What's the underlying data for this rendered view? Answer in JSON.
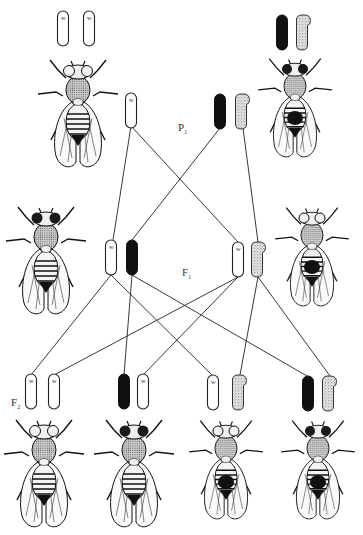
{
  "diagram": {
    "generations": [
      {
        "id": "P1",
        "label": "P",
        "subscript": "1",
        "x": 178,
        "y": 130
      },
      {
        "id": "F1",
        "label": "F",
        "subscript": "1",
        "x": 183,
        "y": 275
      },
      {
        "id": "F2",
        "label": "F",
        "subscript": "2",
        "x": 12,
        "y": 406
      }
    ],
    "chromosome_types": {
      "X_white": {
        "fill": "#ffffff",
        "stroke": "#222222",
        "allele_label": "w",
        "description": "X chromosome carrying white (w) allele"
      },
      "X_red": {
        "fill": "#111111",
        "stroke": "#111111",
        "allele_label": "",
        "description": "X chromosome carrying wild-type red allele"
      },
      "Y": {
        "fill": "#d8d8d8",
        "stroke": "#333333",
        "allele_label": "",
        "description": "Y chromosome (stippled, hooked)"
      }
    },
    "p1": {
      "female": {
        "phenotype": "white-eyed female",
        "eye_color": "white",
        "sex": "female",
        "genotype": [
          "X_white",
          "X_white"
        ],
        "chromosome_labels": [
          "w",
          "w"
        ]
      },
      "male": {
        "phenotype": "red-eyed male",
        "eye_color": "red",
        "sex": "male",
        "genotype": [
          "X_red",
          "Y"
        ],
        "chromosome_labels": [
          "",
          ""
        ]
      },
      "gametes": [
        {
          "type": "X_white",
          "label": "w",
          "from": "female"
        },
        {
          "type": "X_red",
          "label": "",
          "from": "male"
        },
        {
          "type": "Y",
          "label": "",
          "from": "male"
        }
      ]
    },
    "f1": {
      "female": {
        "phenotype": "red-eyed female",
        "eye_color": "red",
        "sex": "female",
        "genotype": [
          "X_white",
          "X_red"
        ],
        "chromosome_labels": [
          "w",
          ""
        ]
      },
      "male": {
        "phenotype": "white-eyed male",
        "eye_color": "white",
        "sex": "male",
        "genotype": [
          "X_white",
          "Y"
        ],
        "chromosome_labels": [
          "w",
          ""
        ]
      }
    },
    "f2": [
      {
        "phenotype": "white-eyed female",
        "eye_color": "white",
        "sex": "female",
        "genotype": [
          "X_white",
          "X_white"
        ],
        "chromosome_labels": [
          "w",
          "w"
        ]
      },
      {
        "phenotype": "red-eyed female",
        "eye_color": "red",
        "sex": "female",
        "genotype": [
          "X_red",
          "X_white"
        ],
        "chromosome_labels": [
          "",
          "w"
        ]
      },
      {
        "phenotype": "white-eyed male",
        "eye_color": "white",
        "sex": "male",
        "genotype": [
          "X_white",
          "Y"
        ],
        "chromosome_labels": [
          "w",
          ""
        ]
      },
      {
        "phenotype": "red-eyed male",
        "eye_color": "red",
        "sex": "male",
        "genotype": [
          "X_red",
          "Y"
        ],
        "chromosome_labels": [
          "",
          ""
        ]
      }
    ],
    "colors": {
      "line": "#222222",
      "ink": "#1a1a1a",
      "red_eye_render": "#1a1a1a",
      "white_eye_render": "#f2f2f2",
      "background": "#ffffff"
    }
  }
}
